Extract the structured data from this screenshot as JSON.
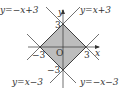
{
  "diagram": {
    "type": "coordinate-plane",
    "region_fill": "#bdbdbd",
    "line_color": "#333333",
    "origin_label": "O",
    "axes": {
      "x_label": "x",
      "y_label": "y"
    },
    "ticks": {
      "x_neg": "−3",
      "x_pos": "3",
      "y_pos": "3",
      "y_neg": "−3"
    },
    "lines": [
      {
        "equation": "y=−x+3"
      },
      {
        "equation": "y=x+3"
      },
      {
        "equation": "y=x−3"
      },
      {
        "equation": "y=−x−3"
      }
    ]
  }
}
